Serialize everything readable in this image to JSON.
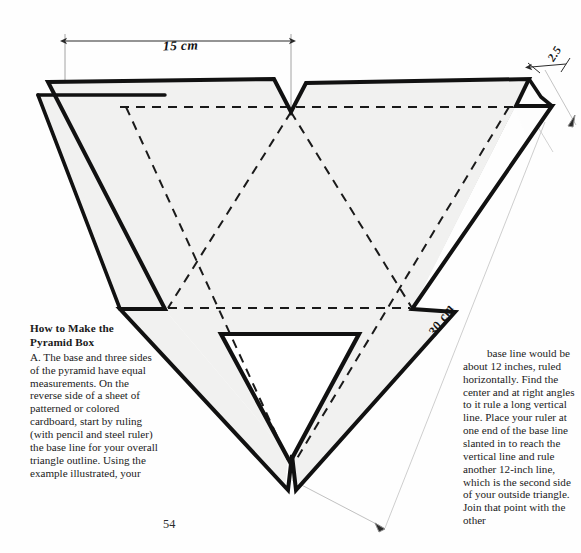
{
  "page": {
    "number": "54",
    "background_color": "#fefefe"
  },
  "figure": {
    "name": "pyramid-box-net-diagram",
    "fill_color": "#f1f1f0",
    "outline_color": "#111111",
    "fold_line_color": "#1a1a1a",
    "dimension_line_color": "#9a9a9a",
    "dimensions": [
      {
        "id": "width",
        "label": "15 cm"
      },
      {
        "id": "side",
        "label": "30 cm"
      },
      {
        "id": "flap",
        "label": "2.5"
      }
    ]
  },
  "left_column": {
    "heading_line1": "How to Make the",
    "heading_line2": "Pyramid Box",
    "body": "A. The base and three sides of the pyramid have equal measurements. On the reverse side of a sheet of patterned or colored cardboard, start by ruling (with pencil and steel ruler) the base line for your overall triangle outline. Using the example illustrated, your"
  },
  "right_column": {
    "body": "base line would be about 12 inches, ruled horizontally. Find the center and at right angles to it rule a long vertical line. Place your ruler at one end of the base line slanted in to reach the vertical line and rule another 12-inch line, which is the second side of your outside triangle. Join that point with the other"
  }
}
